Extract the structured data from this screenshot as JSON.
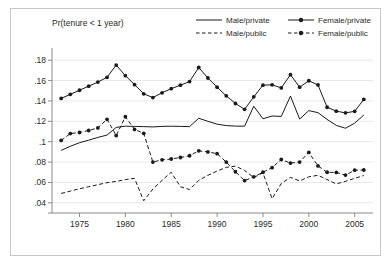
{
  "figure": {
    "title": "Pr(tenure < 1 year)",
    "background": "#ffffff",
    "frame_color": "#c8c8c8",
    "line_color": "#1a1a1a",
    "grid_color": "#e8e8e8"
  },
  "legend": {
    "position": "top-right",
    "entries": [
      {
        "label": "Male/private",
        "style": "solid",
        "marker": false,
        "row": 0,
        "col": 0
      },
      {
        "label": "Female/private",
        "style": "solid",
        "marker": true,
        "row": 0,
        "col": 1
      },
      {
        "label": "Male/public",
        "style": "dashed",
        "marker": false,
        "row": 1,
        "col": 0
      },
      {
        "label": "Female/public",
        "style": "dashed",
        "marker": true,
        "row": 1,
        "col": 1
      }
    ]
  },
  "chart_data": {
    "type": "line",
    "title": "Pr(tenure < 1 year)",
    "xlabel": "",
    "ylabel": "",
    "grid": "horizontal",
    "legend_position": "top-right",
    "xlim": [
      1972,
      2007
    ],
    "ylim": [
      0.03,
      0.19
    ],
    "xticks": [
      1975,
      1980,
      1985,
      1990,
      1995,
      2000,
      2005
    ],
    "ytick_labels": [
      ".04",
      ".06",
      ".08",
      ".1",
      ".12",
      ".14",
      ".16",
      ".18"
    ],
    "yticks": [
      0.04,
      0.06,
      0.08,
      0.1,
      0.12,
      0.14,
      0.16,
      0.18
    ],
    "x": [
      1973,
      1974,
      1975,
      1976,
      1977,
      1978,
      1979,
      1980,
      1981,
      1982,
      1983,
      1984,
      1985,
      1986,
      1987,
      1988,
      1989,
      1990,
      1991,
      1992,
      1993,
      1994,
      1995,
      1996,
      1997,
      1998,
      1999,
      2000,
      2001,
      2002,
      2003,
      2004,
      2005,
      2006
    ],
    "series": [
      {
        "name": "Female/private",
        "style": "solid",
        "marker": true,
        "values": [
          0.1425,
          0.1465,
          0.1505,
          0.1545,
          0.1585,
          0.1632,
          0.1752,
          0.1648,
          0.156,
          0.147,
          0.1433,
          0.148,
          0.152,
          0.1555,
          0.159,
          0.1728,
          0.1625,
          0.1535,
          0.145,
          0.1375,
          0.1318,
          0.144,
          0.1555,
          0.1558,
          0.1528,
          0.1658,
          0.1535,
          0.1598,
          0.1557,
          0.1338,
          0.13,
          0.1283,
          0.1298,
          0.1415
        ]
      },
      {
        "name": "Male/private",
        "style": "solid",
        "marker": false,
        "values": [
          0.0915,
          0.0955,
          0.099,
          0.1015,
          0.1042,
          0.1065,
          0.114,
          0.1152,
          0.115,
          0.1148,
          0.1145,
          0.115,
          0.1152,
          0.115,
          0.1148,
          0.123,
          0.12,
          0.1172,
          0.1158,
          0.1153,
          0.1152,
          0.1348,
          0.1225,
          0.1252,
          0.1248,
          0.1448,
          0.1222,
          0.1305,
          0.1285,
          0.1218,
          0.116,
          0.1132,
          0.1182,
          0.1262
        ]
      },
      {
        "name": "Female/public",
        "style": "dashed",
        "marker": true,
        "values": [
          0.1012,
          0.108,
          0.109,
          0.111,
          0.1135,
          0.122,
          0.106,
          0.1245,
          0.112,
          0.1082,
          0.08,
          0.0822,
          0.083,
          0.0845,
          0.0862,
          0.091,
          0.09,
          0.0882,
          0.08,
          0.0705,
          0.0618,
          0.0655,
          0.07,
          0.0745,
          0.0825,
          0.079,
          0.08,
          0.0895,
          0.0762,
          0.07,
          0.0698,
          0.0672,
          0.072,
          0.0722
        ]
      },
      {
        "name": "Male/public",
        "style": "dashed",
        "marker": false,
        "values": [
          0.0492,
          0.0515,
          0.0538,
          0.0558,
          0.0578,
          0.0598,
          0.061,
          0.0628,
          0.064,
          0.042,
          0.0535,
          0.062,
          0.07,
          0.0558,
          0.053,
          0.062,
          0.067,
          0.0712,
          0.0748,
          0.076,
          0.0718,
          0.0648,
          0.0695,
          0.044,
          0.059,
          0.065,
          0.0615,
          0.0655,
          0.067,
          0.0628,
          0.0585,
          0.0612,
          0.064,
          0.0668
        ]
      }
    ]
  }
}
